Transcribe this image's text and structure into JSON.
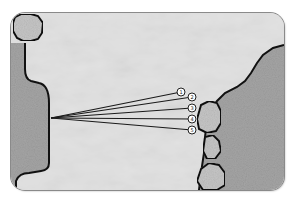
{
  "diagram": {
    "title": "",
    "markers": [
      {
        "label": "1"
      },
      {
        "label": "2"
      },
      {
        "label": "3"
      },
      {
        "label": "4"
      },
      {
        "label": "5"
      }
    ],
    "colors": {
      "background": "#ffffff",
      "water": "#dcdcdc",
      "land": "#a7a7a7",
      "shoreline": "#111111",
      "rope_lines": "#1a1a1a",
      "marker_fill": "#ffffff",
      "rock": "#c4c4c4"
    }
  }
}
